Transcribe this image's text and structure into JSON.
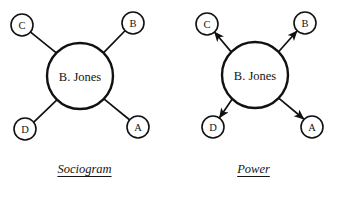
{
  "figure": {
    "background_color": "#ffffff",
    "ink_color": "#111111",
    "panels": [
      {
        "id": "sociogram",
        "caption": "Sociogram",
        "hub": {
          "label": "B. Jones",
          "cx": 80,
          "cy": 76,
          "r": 33
        },
        "edge_style": "plain-line",
        "nodes": [
          {
            "id": "C",
            "label": "C",
            "cx": 22,
            "cy": 25,
            "r": 11,
            "position": "top-left"
          },
          {
            "id": "B",
            "label": "B",
            "cx": 133,
            "cy": 23,
            "r": 11,
            "position": "top-right"
          },
          {
            "id": "D",
            "label": "D",
            "cx": 25,
            "cy": 129,
            "r": 11,
            "position": "bottom-left"
          },
          {
            "id": "A",
            "label": "A",
            "cx": 138,
            "cy": 127,
            "r": 11,
            "position": "bottom-right"
          }
        ],
        "edges": [
          {
            "from": "B. Jones",
            "to": "C",
            "directed": false
          },
          {
            "from": "B. Jones",
            "to": "B",
            "directed": false
          },
          {
            "from": "B. Jones",
            "to": "D",
            "directed": false
          },
          {
            "from": "B. Jones",
            "to": "A",
            "directed": false
          }
        ]
      },
      {
        "id": "power",
        "caption": "Power",
        "hub": {
          "label": "B. Jones",
          "cx": 255,
          "cy": 75,
          "r": 33
        },
        "edge_style": "arrow-outward",
        "nodes": [
          {
            "id": "C",
            "label": "C",
            "cx": 207,
            "cy": 24,
            "r": 11,
            "position": "top-left"
          },
          {
            "id": "B",
            "label": "B",
            "cx": 305,
            "cy": 23,
            "r": 11,
            "position": "top-right"
          },
          {
            "id": "D",
            "label": "D",
            "cx": 213,
            "cy": 127,
            "r": 11,
            "position": "bottom-left"
          },
          {
            "id": "A",
            "label": "A",
            "cx": 312,
            "cy": 127,
            "r": 11,
            "position": "bottom-right"
          }
        ],
        "edges": [
          {
            "from": "B. Jones",
            "to": "C",
            "directed": true
          },
          {
            "from": "B. Jones",
            "to": "B",
            "directed": true
          },
          {
            "from": "B. Jones",
            "to": "D",
            "directed": true
          },
          {
            "from": "B. Jones",
            "to": "A",
            "directed": true
          }
        ]
      }
    ]
  }
}
